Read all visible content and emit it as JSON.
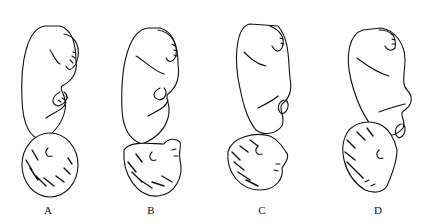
{
  "figure": {
    "type": "illustration",
    "panels": [
      {
        "id": "A",
        "label": "A",
        "description": "fully flexed head, occiput down"
      },
      {
        "id": "B",
        "label": "B",
        "description": "head slightly deflexed, face visible right"
      },
      {
        "id": "C",
        "label": "C",
        "description": "head further extended, brow region"
      },
      {
        "id": "D",
        "label": "D",
        "description": "head fully extended, face presentation"
      }
    ],
    "colors": {
      "line": "#111111",
      "background": "#ffffff"
    }
  }
}
